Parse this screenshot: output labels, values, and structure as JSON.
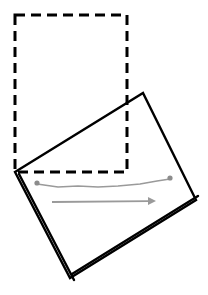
{
  "figure": {
    "canvas": {
      "width": 208,
      "height": 295,
      "background": "#ffffff"
    },
    "elements": {
      "reference_frame": {
        "name": "dashed-reference-rectangle",
        "style": "dashed",
        "stroke_color": "#000000",
        "stroke_width": 3,
        "dash_pattern": "10 6",
        "corners": [
          {
            "x": 15,
            "y": 15
          },
          {
            "x": 127,
            "y": 15
          },
          {
            "x": 127,
            "y": 172
          },
          {
            "x": 15,
            "y": 172
          }
        ]
      },
      "rotated_sheet": {
        "name": "rotated-solid-rectangle",
        "style": "solid",
        "stroke_color": "#000000",
        "stroke_width": 2.4,
        "fill_color": "#ffffff",
        "corners": [
          {
            "x": 15,
            "y": 172
          },
          {
            "x": 143,
            "y": 93
          },
          {
            "x": 196,
            "y": 200
          },
          {
            "x": 70,
            "y": 278
          }
        ],
        "thickness_edges": [
          {
            "from": {
              "x": 15,
              "y": 172
            },
            "to": {
              "x": 70,
              "y": 278
            },
            "offset_x": 4,
            "offset_y": 2
          },
          {
            "from": {
              "x": 70,
              "y": 278
            },
            "to": {
              "x": 196,
              "y": 200
            },
            "offset_x": 2,
            "offset_y": -4
          }
        ]
      },
      "trajectory_path": {
        "name": "gray-wiggly-path",
        "stroke_color": "#9a9a9a",
        "stroke_width": 1.6,
        "points": [
          {
            "x": 37,
            "y": 184
          },
          {
            "x": 58,
            "y": 187
          },
          {
            "x": 78,
            "y": 186
          },
          {
            "x": 98,
            "y": 187
          },
          {
            "x": 118,
            "y": 186
          },
          {
            "x": 140,
            "y": 184
          },
          {
            "x": 157,
            "y": 181
          },
          {
            "x": 170,
            "y": 179
          }
        ],
        "endpoints": [
          {
            "name": "start-dot",
            "x": 37,
            "y": 183,
            "radius": 2.6,
            "color": "#8c8c8c"
          },
          {
            "name": "end-dot",
            "x": 170,
            "y": 178,
            "radius": 2.6,
            "color": "#8c8c8c"
          }
        ]
      },
      "direction_arrow": {
        "name": "gray-direction-arrow",
        "stroke_color": "#9a9a9a",
        "stroke_width": 1.8,
        "start": {
          "x": 52,
          "y": 202
        },
        "end": {
          "x": 156,
          "y": 201
        },
        "head_length": 8,
        "head_half_width": 4
      }
    }
  }
}
